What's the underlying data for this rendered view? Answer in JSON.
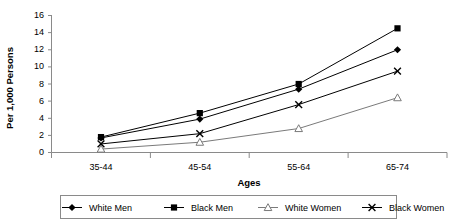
{
  "chart_data": {
    "type": "line",
    "title": "",
    "xlabel": "Ages",
    "ylabel": "Per 1,000 Persons",
    "categories": [
      "35-44",
      "45-54",
      "55-64",
      "65-74"
    ],
    "ylim": [
      0,
      16
    ],
    "yticks": [
      0,
      2,
      4,
      6,
      8,
      10,
      12,
      14,
      16
    ],
    "ytick_labels": [
      "0",
      "2",
      "4",
      "6",
      "8",
      "10",
      "12",
      "14",
      "16"
    ],
    "grid": false,
    "legend_position": "bottom",
    "series": [
      {
        "name": "White Men",
        "marker": "filled-diamond",
        "color": "#000000",
        "values": [
          1.7,
          3.9,
          7.4,
          12.0
        ]
      },
      {
        "name": "Black Men",
        "marker": "filled-square",
        "color": "#000000",
        "values": [
          1.8,
          4.6,
          8.0,
          14.5
        ]
      },
      {
        "name": "White Women",
        "marker": "open-triangle",
        "color": "#7a7a7a",
        "values": [
          0.4,
          1.2,
          2.8,
          6.4
        ]
      },
      {
        "name": "Black Women",
        "marker": "cross-x",
        "color": "#000000",
        "values": [
          1.0,
          2.2,
          5.6,
          9.5
        ]
      }
    ]
  },
  "axes": {
    "y_title": "Per 1,000 Persons",
    "x_title": "Ages"
  },
  "legend": {
    "entries": [
      {
        "label": "White Men",
        "marker": "filled-diamond"
      },
      {
        "label": "Black Men",
        "marker": "filled-square"
      },
      {
        "label": "White Women",
        "marker": "open-triangle"
      },
      {
        "label": "Black Women",
        "marker": "cross-x"
      }
    ]
  }
}
